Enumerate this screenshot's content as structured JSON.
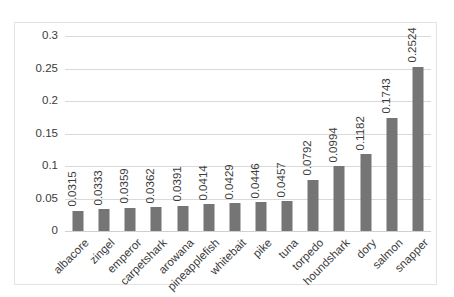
{
  "chart_data": {
    "type": "bar",
    "title": "",
    "subtitle": "",
    "xlabel": "",
    "ylabel": "",
    "orientation": "vertical",
    "grid": true,
    "legend": false,
    "legend_position": "none",
    "bar_color": "#757575",
    "gridline_color": "#d9d9d9",
    "border_color": "#e3e3e3",
    "text_color": "#3b3b3b",
    "ylim": [
      0,
      0.3
    ],
    "ytick_values": [
      0,
      0.05,
      0.1,
      0.15,
      0.2,
      0.25,
      0.3
    ],
    "ytick_labels": [
      "0",
      "0.05",
      "0.1",
      "0.15",
      "0.2",
      "0.25",
      "0.3"
    ],
    "categories": [
      "albacore",
      "zingel",
      "emperor",
      "carpetshark",
      "arowana",
      "pineapplefish",
      "whitebait",
      "pike",
      "tuna",
      "torpedo",
      "houndshark",
      "dory",
      "salmon",
      "snapper"
    ],
    "values": [
      0.0315,
      0.0333,
      0.0359,
      0.0362,
      0.0391,
      0.0414,
      0.0429,
      0.0446,
      0.0457,
      0.0792,
      0.0994,
      0.1182,
      0.1743,
      0.2524
    ],
    "value_labels": [
      "0.0315",
      "0.0333",
      "0.0359",
      "0.0362",
      "0.0391",
      "0.0414",
      "0.0429",
      "0.0446",
      "0.0457",
      "0.0792",
      "0.0994",
      "0.1182",
      "0.1743",
      "0.2524"
    ]
  }
}
